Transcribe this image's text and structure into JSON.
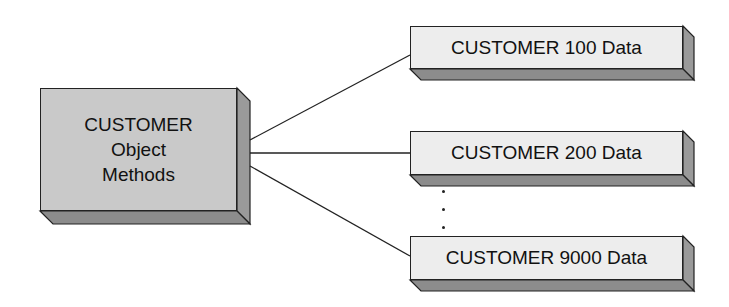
{
  "diagram": {
    "main_box": {
      "lines": [
        "CUSTOMER",
        "Object",
        "Methods"
      ]
    },
    "data_boxes": [
      {
        "label": "CUSTOMER 100 Data"
      },
      {
        "label": "CUSTOMER 200 Data"
      },
      {
        "label": "CUSTOMER 9000 Data"
      }
    ],
    "ellipsis": "⋮",
    "colors": {
      "main_face": "#c9c9c9",
      "data_face": "#ededed",
      "depth": "#8c8c8c",
      "line": "#222222"
    }
  }
}
